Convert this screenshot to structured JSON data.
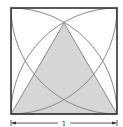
{
  "diagram": {
    "square": {
      "x": 11,
      "y": 8,
      "side": 106,
      "stroke": "#333333"
    },
    "triangle": {
      "apex": [
        64,
        23
      ],
      "base_left": [
        11,
        114
      ],
      "base_right": [
        117,
        114
      ],
      "fill": "#d6d6d6",
      "stroke": "#888888"
    },
    "arcs": {
      "stroke": "#8a8a8a"
    },
    "dimension": {
      "label": "1",
      "y": 123,
      "arrow_color": "#333333"
    }
  }
}
